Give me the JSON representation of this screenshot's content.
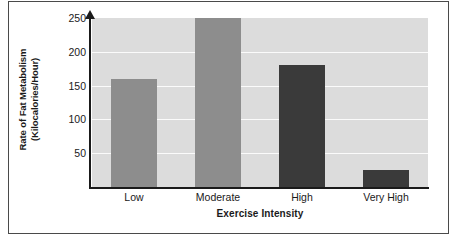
{
  "chart_data": {
    "type": "bar",
    "title": "",
    "xlabel": "Exercise Intensity",
    "ylabel": "Rate of Fat Metabolism (Kilocalories/Hour)",
    "ylabel_line1": "Rate of Fat Metabolism",
    "ylabel_line2": "(Kilocalories/Hour)",
    "categories": [
      "Low",
      "Moderate",
      "High",
      "Very High"
    ],
    "values": [
      160,
      250,
      180,
      25
    ],
    "bar_colors": [
      "#8d8d8d",
      "#8d8d8d",
      "#3a3a3a",
      "#3a3a3a"
    ],
    "ylim": [
      0,
      250
    ],
    "yticks": [
      50,
      100,
      150,
      200,
      250
    ],
    "ytick_labels": [
      "50",
      "100",
      "150",
      "200",
      "250"
    ],
    "grid": true,
    "grid_color": "#fbfbfb",
    "legend": "none",
    "plot_background": "#dcdcdc",
    "axis_color": "#1a1a1a",
    "frame_color": "#4a4a4a"
  }
}
